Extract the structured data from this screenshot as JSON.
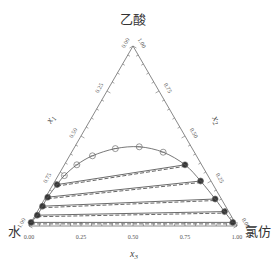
{
  "title": "",
  "vertices": {
    "top": "乙酸",
    "bottom_left": "水",
    "bottom_right": "氯仿"
  },
  "axes": {
    "left": {
      "label": "x",
      "subscript": "1",
      "ticks": [
        "0.00",
        "0.25",
        "0.50",
        "0.75",
        "1.00"
      ]
    },
    "right": {
      "label": "x",
      "subscript": "2",
      "ticks": [
        "1.00",
        "0.75",
        "0.50",
        "0.25",
        "0.00"
      ]
    },
    "bottom": {
      "label": "x",
      "subscript": "3",
      "ticks": [
        "0.00",
        "0.25",
        "0.50",
        "0.75",
        "1.00"
      ]
    }
  },
  "chart_data": {
    "type": "ternary",
    "components": {
      "x1": "水",
      "x2": "乙酸",
      "x3": "氯仿"
    },
    "binodal_points": [
      {
        "x1": 0.98,
        "x2": 0.02,
        "x3": 0.0
      },
      {
        "x1": 0.93,
        "x2": 0.06,
        "x3": 0.01
      },
      {
        "x1": 0.88,
        "x2": 0.11,
        "x3": 0.01
      },
      {
        "x1": 0.83,
        "x2": 0.16,
        "x3": 0.01
      },
      {
        "x1": 0.75,
        "x2": 0.23,
        "x3": 0.02
      },
      {
        "x1": 0.69,
        "x2": 0.28,
        "x3": 0.03
      },
      {
        "x1": 0.6,
        "x2": 0.34,
        "x3": 0.06
      },
      {
        "x1": 0.5,
        "x2": 0.39,
        "x3": 0.11
      },
      {
        "x1": 0.37,
        "x2": 0.43,
        "x3": 0.2
      },
      {
        "x1": 0.25,
        "x2": 0.44,
        "x3": 0.31
      },
      {
        "x1": 0.15,
        "x2": 0.41,
        "x3": 0.44
      },
      {
        "x1": 0.08,
        "x2": 0.34,
        "x3": 0.58
      },
      {
        "x1": 0.05,
        "x2": 0.25,
        "x3": 0.7
      },
      {
        "x1": 0.03,
        "x2": 0.15,
        "x3": 0.82
      },
      {
        "x1": 0.02,
        "x2": 0.08,
        "x3": 0.9
      },
      {
        "x1": 0.01,
        "x2": 0.02,
        "x3": 0.97
      }
    ],
    "tie_lines": [
      {
        "left": {
          "x1": 0.98,
          "x2": 0.02,
          "x3": 0.0
        },
        "right": {
          "x1": 0.01,
          "x2": 0.02,
          "x3": 0.97
        }
      },
      {
        "left": {
          "x1": 0.93,
          "x2": 0.06,
          "x3": 0.01
        },
        "right": {
          "x1": 0.02,
          "x2": 0.08,
          "x3": 0.9
        }
      },
      {
        "left": {
          "x1": 0.88,
          "x2": 0.11,
          "x3": 0.01
        },
        "right": {
          "x1": 0.03,
          "x2": 0.15,
          "x3": 0.82
        }
      },
      {
        "left": {
          "x1": 0.83,
          "x2": 0.16,
          "x3": 0.01
        },
        "right": {
          "x1": 0.05,
          "x2": 0.25,
          "x3": 0.7
        }
      },
      {
        "left": {
          "x1": 0.75,
          "x2": 0.23,
          "x3": 0.02
        },
        "right": {
          "x1": 0.08,
          "x2": 0.34,
          "x3": 0.58
        }
      }
    ],
    "series": [
      {
        "name": "experimental tie lines",
        "style": "solid"
      },
      {
        "name": "calculated tie lines",
        "style": "dashed"
      }
    ],
    "grid": false,
    "legend": "none"
  }
}
